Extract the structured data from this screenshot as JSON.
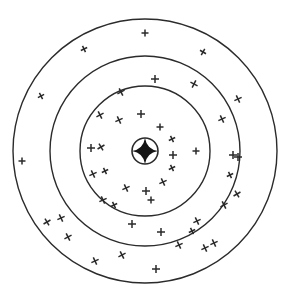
{
  "figure": {
    "name": "shooting-target-scatter",
    "width": 288,
    "height": 303,
    "background_color": "#ffffff",
    "line_color": "#2b2b2b",
    "marker_color": "#2a2a2a",
    "bullseye_color": "#151515"
  },
  "chart_data": {
    "type": "scatter",
    "subtitle": "",
    "xlabel": "",
    "ylabel": "",
    "grid": false,
    "legend": false,
    "center": {
      "x": 145,
      "y": 151
    },
    "rings": [
      {
        "label": "bullseye",
        "radius": 13,
        "stroke_width": 1.6
      },
      {
        "label": "inner-ring",
        "radius": 65,
        "stroke_width": 1.4
      },
      {
        "label": "middle-ring",
        "radius": 95,
        "stroke_width": 1.4
      },
      {
        "label": "outer-ring",
        "radius": 132,
        "stroke_width": 1.4
      }
    ],
    "bullseye_marker": {
      "shape": "four-pointed-star",
      "x": 145,
      "y": 151,
      "size": 13,
      "filled": true
    },
    "marker_count": 46,
    "markers": [
      {
        "x": 145,
        "y": 33,
        "shape": "plus",
        "size": 7,
        "angle": 0
      },
      {
        "x": 84,
        "y": 49,
        "shape": "cross",
        "size": 7,
        "angle": 20
      },
      {
        "x": 203,
        "y": 52,
        "shape": "cross",
        "size": 7,
        "angle": -15
      },
      {
        "x": 41,
        "y": 96,
        "shape": "cross",
        "size": 7,
        "angle": 18
      },
      {
        "x": 22,
        "y": 161,
        "shape": "plus",
        "size": 7,
        "angle": 0
      },
      {
        "x": 47,
        "y": 222,
        "shape": "cross",
        "size": 8,
        "angle": 15
      },
      {
        "x": 95,
        "y": 261,
        "shape": "cross",
        "size": 8,
        "angle": 20
      },
      {
        "x": 156,
        "y": 269,
        "shape": "plus",
        "size": 8,
        "angle": 0
      },
      {
        "x": 205,
        "y": 248,
        "shape": "cross",
        "size": 8,
        "angle": 20
      },
      {
        "x": 237,
        "y": 194,
        "shape": "cross",
        "size": 8,
        "angle": 15
      },
      {
        "x": 233,
        "y": 155,
        "shape": "plus",
        "size": 8,
        "angle": 0
      },
      {
        "x": 238,
        "y": 99,
        "shape": "cross",
        "size": 8,
        "angle": 20
      },
      {
        "x": 155,
        "y": 79,
        "shape": "plus",
        "size": 8,
        "angle": 0
      },
      {
        "x": 121,
        "y": 92,
        "shape": "cross",
        "size": 8,
        "angle": 18
      },
      {
        "x": 194,
        "y": 84,
        "shape": "cross",
        "size": 8,
        "angle": -18
      },
      {
        "x": 222,
        "y": 119,
        "shape": "cross",
        "size": 8,
        "angle": 20
      },
      {
        "x": 100,
        "y": 115,
        "shape": "cross",
        "size": 8,
        "angle": 18
      },
      {
        "x": 119,
        "y": 120,
        "shape": "cross",
        "size": 8,
        "angle": 20
      },
      {
        "x": 141,
        "y": 114,
        "shape": "plus",
        "size": 8,
        "angle": 0
      },
      {
        "x": 160,
        "y": 127,
        "shape": "plus",
        "size": 7,
        "angle": 0
      },
      {
        "x": 172,
        "y": 139,
        "shape": "cross",
        "size": 7,
        "angle": 20
      },
      {
        "x": 173,
        "y": 155,
        "shape": "plus",
        "size": 8,
        "angle": 0
      },
      {
        "x": 172,
        "y": 168,
        "shape": "cross",
        "size": 7,
        "angle": 20
      },
      {
        "x": 163,
        "y": 182,
        "shape": "cross",
        "size": 8,
        "angle": 20
      },
      {
        "x": 146,
        "y": 191,
        "shape": "plus",
        "size": 8,
        "angle": 0
      },
      {
        "x": 126,
        "y": 188,
        "shape": "cross",
        "size": 8,
        "angle": 20
      },
      {
        "x": 103,
        "y": 200,
        "shape": "cross",
        "size": 8,
        "angle": 20
      },
      {
        "x": 93,
        "y": 174,
        "shape": "cross",
        "size": 8,
        "angle": 20
      },
      {
        "x": 105,
        "y": 171,
        "shape": "cross",
        "size": 7,
        "angle": 20
      },
      {
        "x": 91,
        "y": 148,
        "shape": "plus",
        "size": 8,
        "angle": 0
      },
      {
        "x": 101,
        "y": 147,
        "shape": "cross",
        "size": 8,
        "angle": 15
      },
      {
        "x": 196,
        "y": 151,
        "shape": "plus",
        "size": 7,
        "angle": 0
      },
      {
        "x": 132,
        "y": 224,
        "shape": "plus",
        "size": 8,
        "angle": 0
      },
      {
        "x": 161,
        "y": 232,
        "shape": "plus",
        "size": 8,
        "angle": 0
      },
      {
        "x": 197,
        "y": 221,
        "shape": "cross",
        "size": 8,
        "angle": 20
      },
      {
        "x": 214,
        "y": 243,
        "shape": "cross",
        "size": 8,
        "angle": 20
      },
      {
        "x": 224,
        "y": 205,
        "shape": "cross",
        "size": 8,
        "angle": 18
      },
      {
        "x": 238,
        "y": 157,
        "shape": "plus",
        "size": 8,
        "angle": 0
      },
      {
        "x": 122,
        "y": 255,
        "shape": "cross",
        "size": 8,
        "angle": 18
      },
      {
        "x": 68,
        "y": 237,
        "shape": "cross",
        "size": 8,
        "angle": 18
      },
      {
        "x": 61,
        "y": 218,
        "shape": "cross",
        "size": 8,
        "angle": 20
      },
      {
        "x": 179,
        "y": 245,
        "shape": "cross",
        "size": 8,
        "angle": 20
      },
      {
        "x": 192,
        "y": 231,
        "shape": "cross",
        "size": 7,
        "angle": 20
      },
      {
        "x": 230,
        "y": 175,
        "shape": "cross",
        "size": 7,
        "angle": 20
      },
      {
        "x": 151,
        "y": 200,
        "shape": "plus",
        "size": 7,
        "angle": 0
      },
      {
        "x": 114,
        "y": 205,
        "shape": "cross",
        "size": 7,
        "angle": 20
      }
    ]
  }
}
